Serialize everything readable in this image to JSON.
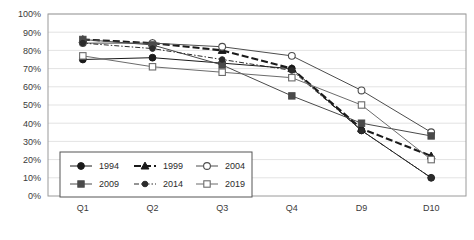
{
  "chart_data": {
    "type": "line",
    "title": "",
    "xlabel": "",
    "ylabel": "",
    "categories": [
      "Q1",
      "Q2",
      "Q3",
      "Q4",
      "D9",
      "D10"
    ],
    "ylim": [
      0,
      100
    ],
    "ytick_labels": [
      "100%",
      "90%",
      "80%",
      "70%",
      "60%",
      "50%",
      "40%",
      "30%",
      "20%",
      "10%",
      "0%"
    ],
    "ytick_values": [
      100,
      90,
      80,
      70,
      60,
      50,
      40,
      30,
      20,
      10,
      0
    ],
    "grid": "horizontal",
    "legend_position": "inside-bottom-left",
    "series": [
      {
        "name": "1994",
        "values": [
          75,
          76,
          73,
          70,
          36,
          10
        ],
        "marker": "filled-circle",
        "line_style": "solid",
        "color": "#1a1a1a"
      },
      {
        "name": "1999",
        "values": [
          86,
          84,
          80,
          70,
          37,
          22
        ],
        "marker": "filled-triangle",
        "line_style": "dashed-bold",
        "color": "#1a1a1a"
      },
      {
        "name": "2004",
        "values": [
          84,
          84,
          82,
          77,
          58,
          35
        ],
        "marker": "open-circle",
        "line_style": "solid",
        "color": "#4d4d4d"
      },
      {
        "name": "2009",
        "values": [
          86,
          83,
          72,
          55,
          40,
          33
        ],
        "marker": "filled-square",
        "line_style": "solid",
        "color": "#4a4a4a"
      },
      {
        "name": "2014",
        "values": [
          84,
          81,
          75,
          69,
          36,
          10
        ],
        "marker": "filled-circle-small",
        "line_style": "dash-dot",
        "color": "#2b2b2b"
      },
      {
        "name": "2019",
        "values": [
          77,
          71,
          68,
          65,
          50,
          20
        ],
        "marker": "open-square",
        "line_style": "solid",
        "color": "#6b6b6b"
      }
    ],
    "legend_entries": [
      {
        "label": "1994",
        "marker": "filled-circle",
        "line_style": "solid"
      },
      {
        "label": "1999",
        "marker": "filled-triangle",
        "line_style": "dashed-bold"
      },
      {
        "label": "2004",
        "marker": "open-circle",
        "line_style": "solid"
      },
      {
        "label": "2009",
        "marker": "filled-square",
        "line_style": "solid"
      },
      {
        "label": "2014",
        "marker": "filled-circle-small",
        "line_style": "dash-dot"
      },
      {
        "label": "2019",
        "marker": "open-square",
        "line_style": "solid"
      }
    ]
  },
  "colors": {
    "background": "#ffffff",
    "plot_border": "#9a9a9a",
    "gridline": "#e3e3e3",
    "axis_text": "#3a3a3a",
    "legend_border": "#555555"
  }
}
